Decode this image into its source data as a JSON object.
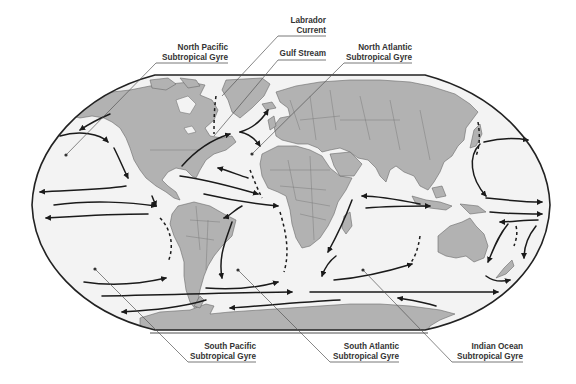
{
  "figure": {
    "colors": {
      "ocean": "#f3f3f3",
      "land": "#b2b2b2",
      "frame": "#222222",
      "current_arrows": "#1a1a1a",
      "label_text": "#333333"
    }
  },
  "labels": {
    "labrador": {
      "line1": "Labrador",
      "line2": "Current"
    },
    "gulf_stream": {
      "line1": "Gulf Stream"
    },
    "north_pacific": {
      "line1": "North Pacific",
      "line2": "Subtropical Gyre"
    },
    "north_atlantic": {
      "line1": "North Atlantic",
      "line2": "Subtropical Gyre"
    },
    "south_pacific": {
      "line1": "South Pacific",
      "line2": "Subtropical Gyre"
    },
    "south_atlantic": {
      "line1": "South Atlantic",
      "line2": "Subtropical Gyre"
    },
    "indian_ocean": {
      "line1": "Indian Ocean",
      "line2": "Subtropical Gyre"
    }
  },
  "map_features": {
    "continents": [
      "North America",
      "South America",
      "Greenland",
      "Europe",
      "Asia",
      "Africa",
      "Australia",
      "Antarctica",
      "Madagascar",
      "New Zealand"
    ],
    "arrow_icons": [
      "current-arrow-icon",
      "dashed-current-icon",
      "gyre-center-dot-icon"
    ]
  }
}
